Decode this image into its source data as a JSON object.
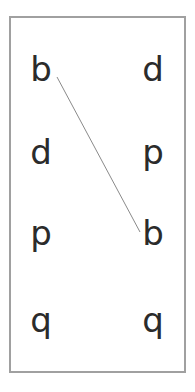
{
  "worksheet": {
    "left_column": [
      "b",
      "d",
      "p",
      "q"
    ],
    "right_column": [
      "d",
      "p",
      "b",
      "q"
    ],
    "connections": [
      {
        "from_left_index": 0,
        "to_right_index": 2,
        "letter": "b"
      }
    ],
    "colors": {
      "border": "#a0a0a0",
      "text": "#2b2b2b",
      "line": "#8a8a8a"
    }
  }
}
